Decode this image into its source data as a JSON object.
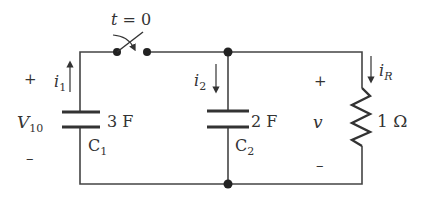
{
  "switch": {
    "label": "t = 0",
    "label_t": "t",
    "label_eq": " = 0"
  },
  "source": {
    "voltage_symbol": "V",
    "voltage_subscript": "10",
    "plus": "+",
    "minus": "–"
  },
  "current_i1": {
    "symbol": "i",
    "subscript": "1"
  },
  "current_i2": {
    "symbol": "i",
    "subscript": "2"
  },
  "current_iR": {
    "symbol": "i",
    "subscript": "R"
  },
  "capacitor_c1": {
    "value": "3 F",
    "name": "C",
    "subscript": "1"
  },
  "capacitor_c2": {
    "value": "2 F",
    "name": "C",
    "subscript": "2"
  },
  "output_voltage": {
    "symbol": "v",
    "plus": "+",
    "minus": "–"
  },
  "resistor": {
    "value": "1 Ω"
  }
}
